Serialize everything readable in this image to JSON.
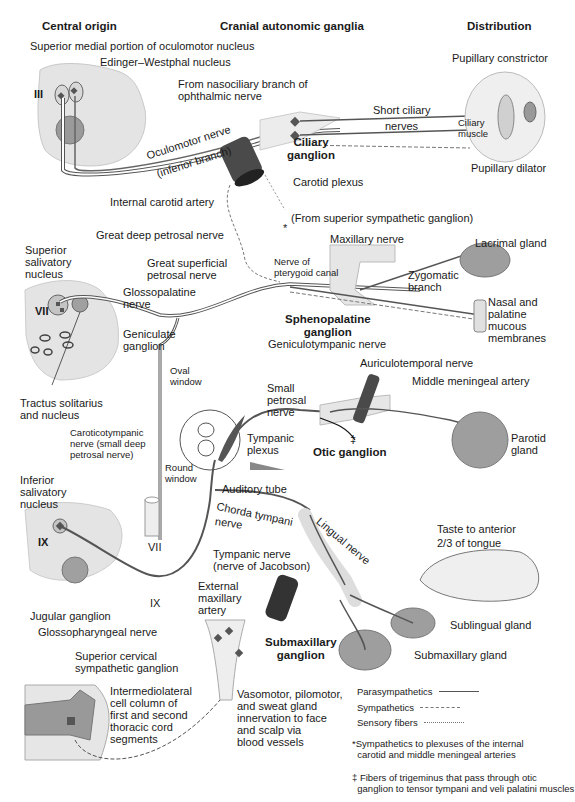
{
  "headers": {
    "central": "Central origin",
    "ganglia": "Cranial autonomic ganglia",
    "distribution": "Distribution"
  },
  "labels": {
    "sup_medial_oculomotor": "Superior medial portion of oculomotor nucleus",
    "edinger_westphal": "Edinger–Westphal nucleus",
    "roman_iii": "III",
    "nasociliary": "From nasociliary branch of\nophthalmic nerve",
    "oculomotor_nerve": "Oculomotor nerve",
    "inferior_branch": "(inferior branch)",
    "short_ciliary": "Short ciliary",
    "nerves": "nerves",
    "ciliary_muscle": "Ciliary\nmuscle",
    "pupillary_constrictor": "Pupillary constrictor",
    "pupillary_dilator": "Pupillary dilator",
    "ciliary_ganglion": "Ciliary\nganglion",
    "carotid_plexus": "Carotid plexus",
    "internal_carotid": "Internal carotid artery",
    "from_sup_symp": "(From superior sympathetic ganglion)",
    "star": "*",
    "great_deep_petrosal": "Great deep petrosal nerve",
    "maxillary_nerve": "Maxillary nerve",
    "lacrimal_gland": "Lacrimal gland",
    "sup_salivatory": "Superior\nsalivatory\nnucleus",
    "great_sup_petrosal": "Great superficial\npetrosal nerve",
    "nerve_pterygoid": "Nerve of\npterygoid canal",
    "zygomatic_branch": "Zygomatic\nbranch",
    "glossopalatine": "Glossopalatine\nnerve",
    "roman_vii": "VII",
    "nasal_palatine": "Nasal and\npalatine\nmucous\nmembranes",
    "sphenopalatine": "Sphenopalatine\nganglion",
    "geniculate": "Geniculate\nganglion",
    "geniculotympanic": "Geniculotympanic nerve",
    "auriculotemporal": "Auriculotemporal nerve",
    "oval_window": "Oval\nwindow",
    "small_petrosal": "Small\npetrosal\nnerve",
    "middle_meningeal": "Middle meningeal artery",
    "tractus": "Tractus solitarius\nand nucleus",
    "caroticotympanic": "Caroticotympanic\nnerve (small deep\npetrosal nerve)",
    "round_window": "Round\nwindow",
    "tympanic_plexus": "Tympanic\nplexus",
    "dagger": "‡",
    "otic_ganglion": "Otic ganglion",
    "parotid": "Parotid\ngland",
    "auditory_tube": "Auditory tube",
    "inf_salivatory": "Inferior\nsalivatory\nnucleus",
    "roman_ix": "IX",
    "roman_vii_b": "VII",
    "chorda_tympani": "Chorda tympani",
    "chorda_nerve": "nerve",
    "lingual_nerve": "Lingual nerve",
    "taste": "Taste to anterior",
    "taste2": "2/3 of tongue",
    "tympanic_nerve": "Tympanic nerve\n(nerve of Jacobson)",
    "external_maxillary": "External\nmaxillary\nartery",
    "jugular_ganglion": "Jugular ganglion",
    "roman_ix_b": "IX",
    "glossopharyngeal": "Glossopharyngeal nerve",
    "submaxillary_ganglion": "Submaxillary\nganglion",
    "sublingual": "Sublingual gland",
    "submaxillary_gland": "Submaxillary gland",
    "sup_cervical": "Superior cervical\nsympathetic ganglion",
    "intermediolateral": "Intermediolateral\ncell column of\nfirst and second\nthoracic cord\nsegments",
    "vasomotor": "Vasomotor, pilomotor,\nand sweat gland\ninnervation to face\nand scalp via\nblood vessels"
  },
  "legend": {
    "items": [
      {
        "label": "Parasympathetics",
        "style": "solid"
      },
      {
        "label": "Sympathetics",
        "style": "dashed"
      },
      {
        "label": "Sensory fibers",
        "style": "dotted"
      }
    ],
    "note_star": "*Sympathetics to plexuses of the internal\n  carotid and middle meningeal arteries",
    "note_dagger": "‡ Fibers of trigeminus that pass through otic\n  ganglion to tensor tympani and veli palatini muscles"
  },
  "colors": {
    "tissue": "#e6e6e6",
    "tissue_dark": "#9a9a9a",
    "nerve": "#555555",
    "artery": "#3c3c3c",
    "gland": "#9e9e9e"
  }
}
